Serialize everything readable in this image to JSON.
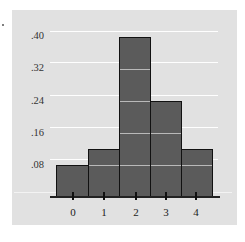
{
  "chart_data": {
    "type": "bar",
    "title": "",
    "xlabel": "",
    "ylabel": "",
    "categories": [
      "0",
      "1",
      "2",
      "3",
      "4"
    ],
    "values": [
      0.08,
      0.12,
      0.4,
      0.24,
      0.12
    ],
    "yticks": [
      ".08",
      ".16",
      ".24",
      ".32",
      ".40"
    ],
    "ylim": [
      0,
      0.4
    ],
    "grid": true,
    "legend": null
  },
  "colors": {
    "panel_bg": "#e1e1e1",
    "bar_fill": "#5b5b5b",
    "bar_edge": "#111111",
    "gridline": "#ffffff"
  },
  "labels": {
    "y": [
      ".40",
      ".32",
      ".24",
      ".16",
      ".08"
    ],
    "x": [
      "0",
      "1",
      "2",
      "3",
      "4"
    ]
  }
}
